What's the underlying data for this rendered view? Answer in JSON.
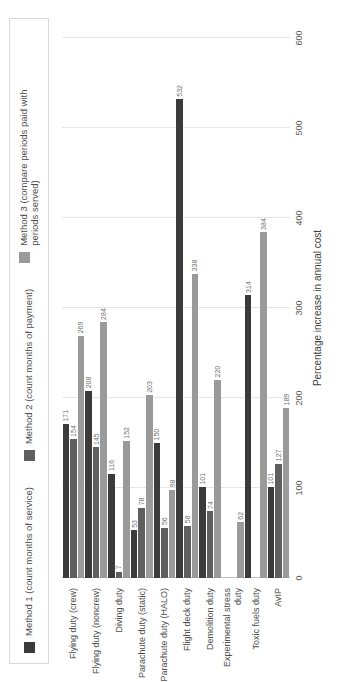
{
  "chart_data": {
    "type": "bar",
    "orientation": "horizontal",
    "title": "",
    "xlabel": "Percentage increase in annual cost",
    "ylabel": "",
    "xlim": [
      0,
      600
    ],
    "xticks": [
      "0",
      "100",
      "200",
      "300",
      "400",
      "500",
      "600"
    ],
    "grid": true,
    "legend_position": "top",
    "categories": [
      "Flying duty (crew)",
      "Flying duty (noncrew)",
      "Diving duty",
      "Parachute duty (static)",
      "Parachute duty (HALO)",
      "Flight deck duty",
      "Demolition duty",
      "Experimental stress duty",
      "Toxic fuels duty",
      "AvIP"
    ],
    "series": [
      {
        "name": "Method 1 (count months of service)",
        "color": "#3b3b3b",
        "values": [
          171,
          208,
          116,
          53,
          150,
          532,
          101,
          0,
          314,
          101
        ]
      },
      {
        "name": "Method 2 (count months of payment)",
        "color": "#5f5f5f",
        "values": [
          154,
          145,
          7,
          78,
          56,
          58,
          74,
          0,
          0,
          127
        ]
      },
      {
        "name": "Method 3 (compare periods paid with periods served)",
        "color": "#9a9a9a",
        "values": [
          269,
          284,
          152,
          203,
          98,
          338,
          220,
          62,
          384,
          189
        ]
      }
    ]
  }
}
